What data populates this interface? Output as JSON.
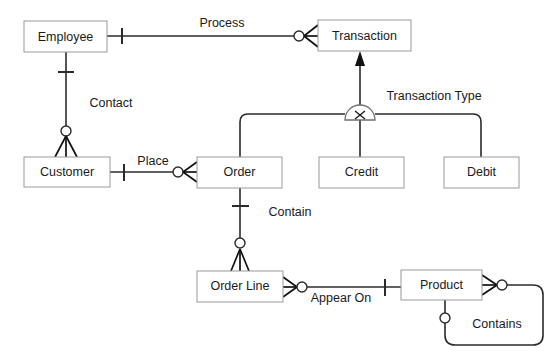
{
  "diagram": {
    "type": "entity-relationship-diagram",
    "notation": "crows-foot",
    "canvas": {
      "width": 560,
      "height": 356
    },
    "background_color": "#ffffff",
    "line_color": "#2b2b2b",
    "box_border_color": "#9a9a9a",
    "text_color": "#1a1a1a"
  },
  "entities": [
    {
      "id": "employee",
      "label": "Employee",
      "x": 24,
      "y": 21,
      "w": 83,
      "h": 31
    },
    {
      "id": "transaction",
      "label": "Transaction",
      "x": 318,
      "y": 20,
      "w": 93,
      "h": 31
    },
    {
      "id": "customer",
      "label": "Customer",
      "x": 24,
      "y": 157,
      "w": 86,
      "h": 30
    },
    {
      "id": "order",
      "label": "Order",
      "x": 197,
      "y": 157,
      "w": 85,
      "h": 31
    },
    {
      "id": "credit",
      "label": "Credit",
      "x": 319,
      "y": 157,
      "w": 85,
      "h": 31
    },
    {
      "id": "debit",
      "label": "Debit",
      "x": 444,
      "y": 157,
      "w": 75,
      "h": 31
    },
    {
      "id": "orderline",
      "label": "Order Line",
      "x": 197,
      "y": 271,
      "w": 86,
      "h": 31
    },
    {
      "id": "product",
      "label": "Product",
      "x": 401,
      "y": 270,
      "w": 81,
      "h": 30
    }
  ],
  "relationships": [
    {
      "id": "process",
      "label": "Process",
      "from": "employee",
      "to": "transaction",
      "label_x": 222,
      "label_y": 24
    },
    {
      "id": "contact",
      "label": "Contact",
      "from": "employee",
      "to": "customer",
      "label_x": 111,
      "label_y": 104
    },
    {
      "id": "place",
      "label": "Place",
      "from": "customer",
      "to": "order",
      "label_x": 153,
      "label_y": 162
    },
    {
      "id": "contain",
      "label": "Contain",
      "from": "order",
      "to": "orderline",
      "label_x": 290,
      "label_y": 213
    },
    {
      "id": "appear-on",
      "label": "Appear On",
      "from": "orderline",
      "to": "product",
      "label_x": 341,
      "label_y": 299
    },
    {
      "id": "contains",
      "label": "Contains",
      "from": "product",
      "to": "product",
      "label_x": 497,
      "label_y": 325
    },
    {
      "id": "transaction-type",
      "label": "Transaction Type",
      "from": "transaction",
      "to": "credit-debit",
      "label_x": 434,
      "label_y": 97
    }
  ],
  "subtype_group": {
    "id": "transaction-type-xor",
    "symbol": "X",
    "supertype": "transaction",
    "subtypes": [
      "credit",
      "debit"
    ],
    "center_x": 360,
    "center_y": 120
  },
  "legend_notes": {
    "mandatory_marker": "tick",
    "optional_marker": "circle",
    "many_marker": "crows-foot",
    "inheritance_marker": "solid-arrow"
  }
}
